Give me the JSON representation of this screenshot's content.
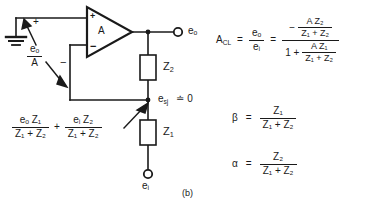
{
  "figure": {
    "label": "(b)",
    "type": "operational-amplifier-feedback-circuit",
    "bottom_caption": "",
    "opamp": {
      "gain_label": "A",
      "plus_label": "+",
      "minus_label": "−"
    },
    "nodes": {
      "output_terminal": "eₒ",
      "input_terminal": "eᵢ",
      "summing_junction": "e",
      "summing_junction_sub": "sj",
      "summing_junction_value": "≐ 0"
    },
    "components": {
      "feedback_impedance": "Z",
      "feedback_impedance_sub": "2",
      "input_impedance": "Z",
      "input_impedance_sub": "1"
    },
    "annotations": {
      "plus_arrow_sign": "+",
      "minus_arrow_sign": "−",
      "error_voltage_num": "eₒ",
      "error_voltage_den": "A"
    },
    "superposition": {
      "term1_num": "eₒ Z₁",
      "term1_den": "Z₁ + Z₂",
      "operator": "+",
      "term2_num": "eᵢ Z₂",
      "term2_den": "Z₁ + Z₂"
    }
  },
  "equations": {
    "acl": {
      "lhs": "A",
      "lhs_sub": "CL",
      "eq1": "=",
      "ratio_num": "eₒ",
      "ratio_den": "eᵢ",
      "eq2": "=",
      "minus": "−",
      "num_num": "A Z₂",
      "num_den": "Z₁ + Z₂",
      "den_one": "1 +",
      "den_num": "A Z₁",
      "den_den": "Z₁ + Z₂"
    },
    "beta": {
      "lhs": "β",
      "eq": "=",
      "num": "Z₁",
      "den": "Z₁ + Z₂"
    },
    "alpha": {
      "lhs": "α",
      "eq": "=",
      "num": "Z₂",
      "den": "Z₁ + Z₂"
    }
  }
}
